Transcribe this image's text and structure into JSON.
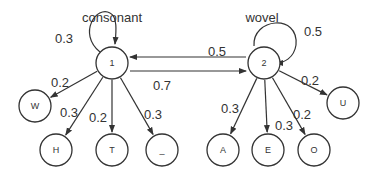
{
  "diagram": {
    "groups": [
      {
        "id": "consonant",
        "label": "consonant",
        "x": 112,
        "y": 17
      },
      {
        "id": "wovel",
        "label": "wovel",
        "x": 262,
        "y": 17
      }
    ],
    "nodes": [
      {
        "id": "n1",
        "label": "1",
        "x": 112,
        "y": 63
      },
      {
        "id": "n2",
        "label": "2",
        "x": 264,
        "y": 63
      },
      {
        "id": "W",
        "label": "W",
        "x": 35,
        "y": 106
      },
      {
        "id": "H",
        "label": "H",
        "x": 56,
        "y": 150
      },
      {
        "id": "T",
        "label": "T",
        "x": 112,
        "y": 150
      },
      {
        "id": "_",
        "label": "_",
        "x": 162,
        "y": 150
      },
      {
        "id": "A",
        "label": "A",
        "x": 223,
        "y": 150
      },
      {
        "id": "E",
        "label": "E",
        "x": 268,
        "y": 150
      },
      {
        "id": "O",
        "label": "O",
        "x": 314,
        "y": 150
      },
      {
        "id": "U",
        "label": "U",
        "x": 343,
        "y": 103
      }
    ],
    "edges": [
      {
        "from": "n1",
        "to": "n1",
        "weight": "0.3",
        "lx": 64,
        "ly": 38
      },
      {
        "from": "n2",
        "to": "n1",
        "weight": "0.5",
        "lx": 217,
        "ly": 51
      },
      {
        "from": "n1",
        "to": "n2",
        "weight": "0.7",
        "lx": 162,
        "ly": 85
      },
      {
        "from": "n2",
        "to": "n2",
        "weight": "0.5",
        "lx": 313,
        "ly": 31
      },
      {
        "from": "n1",
        "to": "W",
        "weight": "0.2",
        "lx": 60,
        "ly": 82
      },
      {
        "from": "n1",
        "to": "H",
        "weight": "0.3",
        "lx": 69,
        "ly": 112
      },
      {
        "from": "n1",
        "to": "T",
        "weight": "0.2",
        "lx": 98,
        "ly": 117
      },
      {
        "from": "n1",
        "to": "_",
        "weight": "0.3",
        "lx": 153,
        "ly": 114
      },
      {
        "from": "n2",
        "to": "A",
        "weight": "0.3",
        "lx": 230,
        "ly": 108
      },
      {
        "from": "n2",
        "to": "E",
        "weight": "0.3",
        "lx": 284,
        "ly": 125
      },
      {
        "from": "n2",
        "to": "O",
        "weight": "0.2",
        "lx": 302,
        "ly": 114
      },
      {
        "from": "n2",
        "to": "U",
        "weight": "0.2",
        "lx": 310,
        "ly": 80
      }
    ]
  },
  "colors": {
    "stroke": "#333333",
    "text": "#333333",
    "background": "#ffffff"
  }
}
